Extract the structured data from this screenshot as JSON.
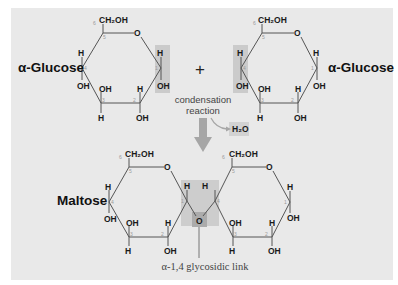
{
  "diagram": {
    "reactants": {
      "left_label": "α-Glucose",
      "right_label": "α-Glucose",
      "plus": "+"
    },
    "reaction": {
      "line1": "condensation",
      "line2": "reaction",
      "byproduct": "H₂O",
      "byproduct_sub": "2"
    },
    "product": {
      "label": "Maltose",
      "link_label": "α-1,4 glycosidic link"
    },
    "groups": {
      "ch2oh": "CH₂OH",
      "oh": "OH",
      "h": "H",
      "o": "O"
    },
    "carbon_numbers": [
      "1",
      "2",
      "3",
      "4",
      "5",
      "6"
    ],
    "colors": {
      "background": "#e9e9e9",
      "highlight": "#c9c9c9",
      "highlight_dark": "#aaaaaa",
      "arrow": "#a6a6a6",
      "bond": "#555555",
      "text": "#1a1a1a"
    }
  }
}
